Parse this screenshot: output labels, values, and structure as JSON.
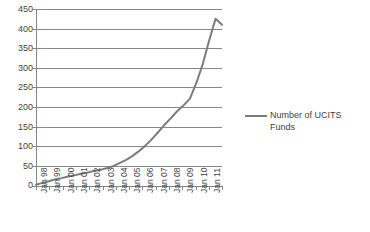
{
  "chart_data": {
    "type": "line",
    "title": "",
    "xlabel": "",
    "ylabel": "",
    "ylim": [
      0,
      450
    ],
    "yticks": [
      0,
      50,
      100,
      150,
      200,
      250,
      300,
      350,
      400,
      450
    ],
    "grid": true,
    "legend_position": "right",
    "xtick_labels": [
      "Jan 98",
      "Jan 99",
      "Jan 00",
      "Jan 01",
      "Jan 02",
      "Jan 03",
      "Jan 04",
      "Jan 05",
      "Jan 06",
      "Jan 07",
      "Jan 08",
      "Jan 09",
      "Jan 10",
      "Jan 11"
    ],
    "series": [
      {
        "name": "Number of UCITS Funds",
        "color": "#7b7b7b",
        "x": [
          "Jan 98",
          "Jul 98",
          "Jan 99",
          "Jul 99",
          "Jan 00",
          "Jul 00",
          "Jan 01",
          "Jul 01",
          "Jan 02",
          "Jul 02",
          "Jan 03",
          "Jul 03",
          "Jan 04",
          "Jul 04",
          "Jan 05",
          "Jul 05",
          "Jan 06",
          "Jul 06",
          "Jan 07",
          "Jul 07",
          "Jan 08",
          "Jul 08",
          "Jan 09",
          "Jul 09",
          "Jan 10",
          "Jul 10",
          "Jan 11",
          "Jul 11",
          "Nov 11",
          "Dec 11"
        ],
        "values": [
          3,
          8,
          12,
          17,
          20,
          24,
          27,
          31,
          34,
          38,
          41,
          45,
          50,
          58,
          66,
          76,
          88,
          102,
          118,
          136,
          155,
          172,
          190,
          205,
          222,
          262,
          310,
          370,
          425,
          410
        ]
      }
    ]
  },
  "legend": {
    "entries": [
      {
        "label": "Number of UCITS Funds"
      }
    ]
  }
}
